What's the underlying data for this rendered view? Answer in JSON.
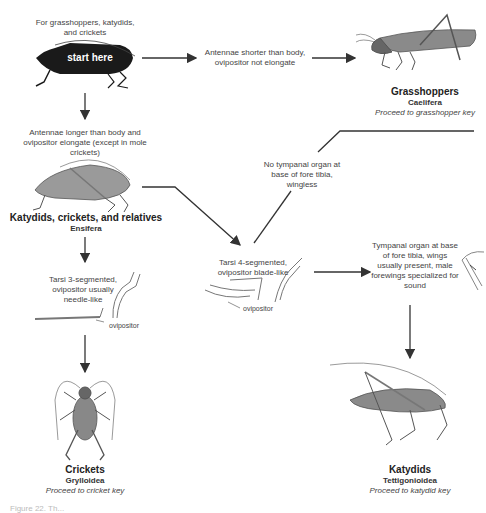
{
  "start": {
    "intro": "For grasshoppers, katydids, and crickets",
    "label": "start here"
  },
  "branches": {
    "short_antennae": "Antennae shorter than body, ovipositor not elongate",
    "long_antennae": "Antennae longer than body and ovipositor elongate (except in mole crickets)",
    "tarsi3": "Tarsi 3-segmented, ovipositor usually needle-like",
    "tarsi4": "Tarsi 4-segmented, ovipositor blade-like",
    "no_tympanal": "No tympanal organ at base of fore tibia, wingless",
    "tympanal": "Tympanal organ at base of fore tibia, wings usually present, male forewings specialized for sound"
  },
  "labels": {
    "ovipositor_1": "ovipositor",
    "ovipositor_2": "ovipositor"
  },
  "taxa": {
    "grasshoppers": {
      "name": "Grasshoppers",
      "group": "Caelifera",
      "next": "Proceed to grasshopper key"
    },
    "ensifera": {
      "name": "Katydids, crickets, and relatives",
      "group": "Ensifera"
    },
    "crickets": {
      "name": "Crickets",
      "group": "Grylloidea",
      "next": "Proceed to cricket key"
    },
    "katydids": {
      "name": "Katydids",
      "group": "Tettigonioidea",
      "next": "Proceed to katydid key"
    }
  },
  "caption": "Figure 22. Th..."
}
